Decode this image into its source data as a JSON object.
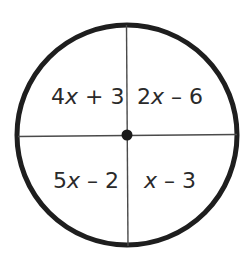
{
  "diagram": {
    "type": "circle-divided-into-quadrants",
    "stroke_color": "#1e1e1e",
    "background": "#ffffff",
    "center_dot": true,
    "quadrants": {
      "top_left": {
        "coefficient": "4",
        "variable": "x",
        "rest": " + 3",
        "expression": "4x + 3"
      },
      "top_right": {
        "coefficient": "2",
        "variable": "x",
        "rest": " – 6",
        "expression": "2x – 6"
      },
      "bottom_left": {
        "coefficient": "5",
        "variable": "x",
        "rest": " – 2",
        "expression": "5x – 2"
      },
      "bottom_right": {
        "coefficient": "",
        "variable": "x",
        "rest": " – 3",
        "expression": "x – 3"
      }
    }
  }
}
